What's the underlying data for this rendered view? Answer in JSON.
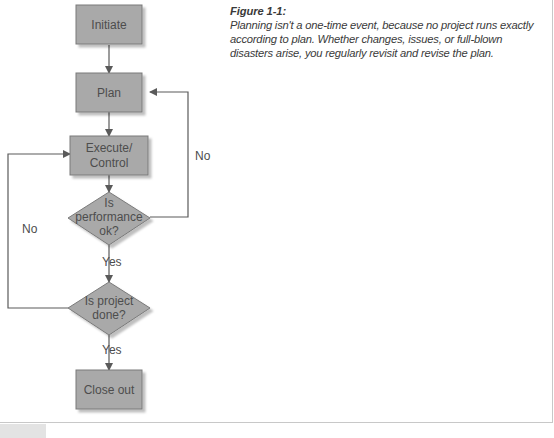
{
  "figure": {
    "title": "Figure 1-1:",
    "caption": "Planning isn't a one-time event, because no project runs exactly according to plan. Whether changes, issues, or full-blown disasters arise, you regularly revisit and revise the plan."
  },
  "diagram": {
    "nodes": [
      {
        "id": "initiate",
        "shape": "rect",
        "lines": [
          "Initiate"
        ]
      },
      {
        "id": "plan",
        "shape": "rect",
        "lines": [
          "Plan"
        ]
      },
      {
        "id": "execute",
        "shape": "rect",
        "lines": [
          "Execute/",
          "Control"
        ]
      },
      {
        "id": "performance",
        "shape": "diamond",
        "lines": [
          "Is",
          "performance",
          "ok?"
        ]
      },
      {
        "id": "done",
        "shape": "diamond",
        "lines": [
          "Is project",
          "done?"
        ]
      },
      {
        "id": "close",
        "shape": "rect",
        "lines": [
          "Close out"
        ]
      }
    ],
    "edges": [
      {
        "from": "initiate",
        "to": "plan",
        "label": ""
      },
      {
        "from": "plan",
        "to": "execute",
        "label": ""
      },
      {
        "from": "execute",
        "to": "performance",
        "label": ""
      },
      {
        "from": "performance",
        "to": "done",
        "label": "Yes"
      },
      {
        "from": "performance",
        "to": "plan",
        "label": "No"
      },
      {
        "from": "done",
        "to": "close",
        "label": "Yes"
      },
      {
        "from": "done",
        "to": "execute",
        "label": "No"
      }
    ],
    "colors": {
      "node_fill": "#a9a9a9",
      "node_stroke": "#7a7a7a",
      "edge": "#5a5a5a",
      "text": "#4d4d4d"
    }
  }
}
